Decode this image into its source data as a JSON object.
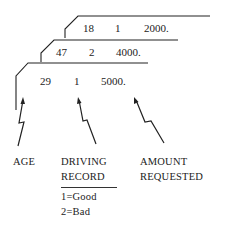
{
  "cards": [
    {
      "age": "18",
      "driving_record": "1",
      "amount": "2000."
    },
    {
      "age": "47",
      "driving_record": "2",
      "amount": "4000."
    },
    {
      "age": "29",
      "driving_record": "1",
      "amount": "5000."
    }
  ],
  "labels": {
    "age": "AGE",
    "driving_record_line1": "DRIVING",
    "driving_record_line2": "RECORD",
    "amount_line1": "AMOUNT",
    "amount_line2": "REQUESTED"
  },
  "legend": {
    "good": "1=Good",
    "bad": "2=Bad"
  }
}
